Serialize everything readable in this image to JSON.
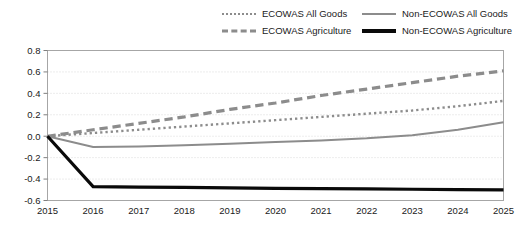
{
  "legend": {
    "entries": [
      {
        "label": "ECOWAS All Goods",
        "style": "dotted",
        "color": "#8c8c8c"
      },
      {
        "label": "Non-ECOWAS All Goods",
        "style": "solid-thin",
        "color": "#8c8c8c"
      },
      {
        "label": "ECOWAS Agriculture",
        "style": "dashed",
        "color": "#8c8c8c"
      },
      {
        "label": "Non-ECOWAS Agriculture",
        "style": "solid-thick",
        "color": "#0a0a0a"
      }
    ]
  },
  "axes": {
    "y_ticks": [
      "0.8",
      "0.6",
      "0.4",
      "0.2",
      "0.0",
      "-0.2",
      "-0.4",
      "-0.6"
    ],
    "x_ticks": [
      "2015",
      "2016",
      "2017",
      "2018",
      "2019",
      "2020",
      "2021",
      "2022",
      "2023",
      "2024",
      "2025"
    ]
  },
  "chart_data": {
    "type": "line",
    "title": "",
    "xlabel": "",
    "ylabel": "",
    "x": [
      2015,
      2016,
      2017,
      2018,
      2019,
      2020,
      2021,
      2022,
      2023,
      2024,
      2025
    ],
    "xlim": [
      2015,
      2025
    ],
    "ylim": [
      -0.6,
      0.8
    ],
    "y_tick_values": [
      0.8,
      0.6,
      0.4,
      0.2,
      0.0,
      -0.2,
      -0.4,
      -0.6
    ],
    "grid": true,
    "grid_axis": "y",
    "legend_position": "top",
    "series": [
      {
        "name": "ECOWAS All Goods",
        "style": "dotted",
        "color": "#8c8c8c",
        "width": 2.4,
        "values": [
          0.0,
          0.03,
          0.06,
          0.09,
          0.12,
          0.15,
          0.18,
          0.21,
          0.24,
          0.28,
          0.33
        ]
      },
      {
        "name": "Non-ECOWAS All Goods",
        "style": "solid",
        "color": "#8c8c8c",
        "width": 2.0,
        "values": [
          0.0,
          -0.1,
          -0.095,
          -0.085,
          -0.07,
          -0.055,
          -0.04,
          -0.02,
          0.01,
          0.06,
          0.13
        ]
      },
      {
        "name": "ECOWAS Agriculture",
        "style": "dashed",
        "color": "#8c8c8c",
        "width": 3.2,
        "values": [
          0.0,
          0.06,
          0.12,
          0.18,
          0.25,
          0.31,
          0.38,
          0.44,
          0.5,
          0.56,
          0.61
        ]
      },
      {
        "name": "Non-ECOWAS Agriculture",
        "style": "solid",
        "color": "#0a0a0a",
        "width": 3.2,
        "values": [
          0.0,
          -0.47,
          -0.475,
          -0.478,
          -0.482,
          -0.486,
          -0.49,
          -0.492,
          -0.495,
          -0.498,
          -0.5
        ]
      }
    ]
  }
}
